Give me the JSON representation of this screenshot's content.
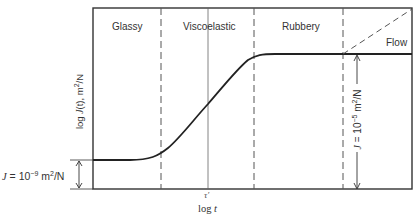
{
  "diagram": {
    "title": "",
    "type": "creep compliance vs log time",
    "regions": [
      {
        "label": "Glassy"
      },
      {
        "label": "Viscoelastic"
      },
      {
        "label": "Rubbery"
      },
      {
        "label": "Flow"
      }
    ],
    "y_axis_label": {
      "prefix": "log ",
      "var": "J",
      "arg": "(t)",
      "unit": ", m",
      "exp": "2",
      "suffix": "/N"
    },
    "x_axis_label": {
      "prefix": "log ",
      "var": "t"
    },
    "tau_label": "τ′",
    "left_annotation": {
      "var": "J",
      "eq": " = 10",
      "exp": "−9",
      "unit": " m",
      "unit_exp": "2",
      "unit_suffix": "/N"
    },
    "right_annotation": {
      "var": "J",
      "eq": " = 10",
      "exp": "−5",
      "unit": " m",
      "unit_exp": "2",
      "unit_suffix": "/N"
    },
    "colors": {
      "line": "#222222",
      "frame": "#333333",
      "dash": "#555555"
    }
  }
}
